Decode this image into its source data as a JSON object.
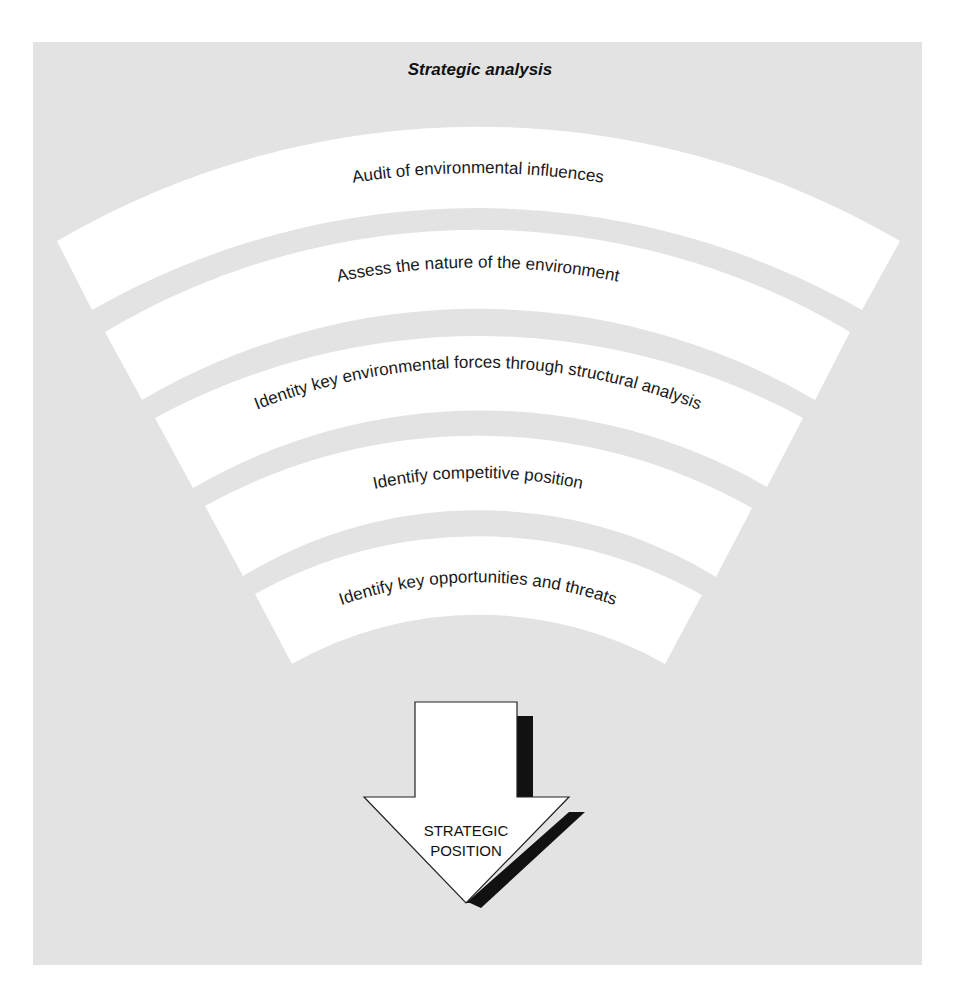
{
  "title": "Strategic analysis",
  "bands": [
    {
      "label": "Audit of environmental influences"
    },
    {
      "label": "Assess the nature of the environment"
    },
    {
      "label": "Identity key environmental forces through structural analysis"
    },
    {
      "label": "Identify competitive position"
    },
    {
      "label": "Identify key opportunities and threats"
    }
  ],
  "outcome": {
    "line1": "STRATEGIC",
    "line2": "POSITION"
  },
  "colors": {
    "panel": "#e3e3e3",
    "band": "#ffffff",
    "text": "#1a1a1a",
    "shadow": "#111111"
  }
}
